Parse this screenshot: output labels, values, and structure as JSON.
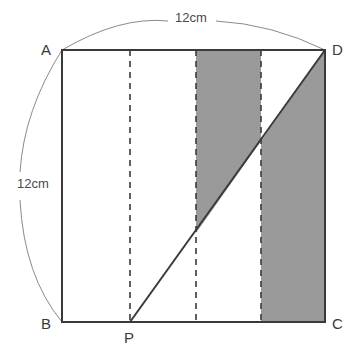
{
  "figure": {
    "type": "geometry-diagram",
    "colors": {
      "shade_fill": "#9a9a9a",
      "outline": "#3a3a3a",
      "dashed": "#3a3a3a",
      "arc": "#8a8a8a",
      "label_text": "#3a3a3a",
      "background": "#ffffff"
    },
    "square": {
      "name": "ABCD",
      "side_length_label": "12cm",
      "corners": {
        "A": {
          "label": "A",
          "x": 62,
          "y": 50
        },
        "B": {
          "label": "B",
          "x": 62,
          "y": 322
        },
        "C": {
          "label": "C",
          "x": 325,
          "y": 322
        },
        "D": {
          "label": "D",
          "x": 325,
          "y": 50
        }
      }
    },
    "points": {
      "P": {
        "label": "P",
        "x": 130,
        "y": 322,
        "on_edge": "BC"
      }
    },
    "diagonal": {
      "name": "PD",
      "from": "P",
      "to": "D",
      "x1": 130,
      "y1": 322,
      "x2": 325,
      "y2": 50
    },
    "dashed_lines": [
      {
        "name": "dashed-at-P",
        "x": 130
      },
      {
        "name": "dashed-band-left",
        "x": 196
      },
      {
        "name": "dashed-band-right",
        "x": 261
      }
    ],
    "shaded_regions": [
      {
        "name": "band-above-diagonal",
        "x_from": 196,
        "x_to": 261,
        "position": "above the diagonal PD",
        "polygon": "196,50 261,50 261,141 196,233"
      },
      {
        "name": "band-below-diagonal",
        "x_from": 261,
        "x_to": 325,
        "position": "below the diagonal PD",
        "polygon": "261,141 325,50 325,322 261,322"
      }
    ],
    "dimensions": [
      {
        "name": "top-dimension",
        "label": "12cm",
        "side": "AD",
        "orientation": "horizontal"
      },
      {
        "name": "left-dimension",
        "label": "12cm",
        "side": "AB",
        "orientation": "vertical"
      }
    ]
  }
}
